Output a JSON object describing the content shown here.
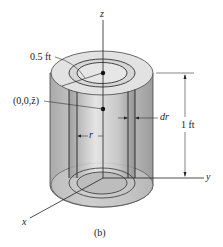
{
  "figure": {
    "caption": "(b)",
    "labels": {
      "z_axis": "z",
      "y_axis": "y",
      "x_axis": "x",
      "radius": "0.5 ft",
      "centroid": "(0,0,z̄)",
      "shell_thickness": "dr",
      "shell_radius": "r",
      "height": "1 ft"
    },
    "colors": {
      "outer_face": "#b9b9b9",
      "top_face": "#dedede",
      "shell": "#cfcfcf",
      "line": "#333333"
    }
  }
}
